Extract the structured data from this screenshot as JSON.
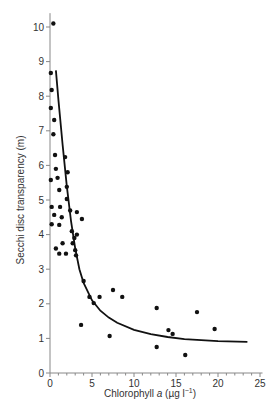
{
  "chart_data": {
    "type": "scatter",
    "title": "",
    "xlabel": "Chlorophyll a (µg l⁻¹)",
    "xlabel_parts": {
      "pre": "Chlorophyll ",
      "italic": "a",
      "post": " (µg l",
      "sup": "−1",
      "end": ")"
    },
    "ylabel": "Secchi disc transparency (m)",
    "xlim": [
      0,
      25
    ],
    "ylim": [
      0,
      10
    ],
    "x_ticks": [
      0,
      5,
      10,
      15,
      20,
      25
    ],
    "y_ticks": [
      0,
      1,
      2,
      3,
      4,
      5,
      6,
      7,
      8,
      9,
      10
    ],
    "grid": false,
    "legend": null,
    "series": [
      {
        "name": "observations",
        "kind": "scatter",
        "points": [
          [
            0.4,
            10.1
          ],
          [
            0.1,
            8.67
          ],
          [
            0.2,
            8.18
          ],
          [
            0.1,
            7.66
          ],
          [
            0.5,
            7.31
          ],
          [
            0.4,
            6.9
          ],
          [
            0.6,
            6.3
          ],
          [
            1.8,
            6.24
          ],
          [
            0.7,
            5.9
          ],
          [
            2.1,
            5.8
          ],
          [
            0.1,
            5.58
          ],
          [
            0.9,
            5.64
          ],
          [
            2.0,
            5.38
          ],
          [
            1.1,
            5.29
          ],
          [
            2.0,
            5.03
          ],
          [
            0.2,
            4.8
          ],
          [
            1.2,
            4.8
          ],
          [
            2.4,
            4.7
          ],
          [
            3.2,
            4.65
          ],
          [
            0.5,
            4.57
          ],
          [
            1.4,
            4.5
          ],
          [
            3.8,
            4.45
          ],
          [
            0.2,
            4.3
          ],
          [
            1.1,
            4.28
          ],
          [
            2.6,
            4.1
          ],
          [
            3.2,
            4.0
          ],
          [
            1.5,
            3.75
          ],
          [
            2.9,
            3.9
          ],
          [
            2.7,
            3.75
          ],
          [
            0.7,
            3.6
          ],
          [
            1.1,
            3.45
          ],
          [
            1.9,
            3.45
          ],
          [
            3.0,
            3.55
          ],
          [
            3.1,
            3.4
          ],
          [
            4.0,
            2.66
          ],
          [
            4.7,
            2.2
          ],
          [
            5.2,
            2.02
          ],
          [
            5.9,
            2.2
          ],
          [
            7.5,
            2.4
          ],
          [
            8.6,
            2.2
          ],
          [
            3.7,
            1.39
          ],
          [
            7.1,
            1.07
          ],
          [
            12.7,
            1.88
          ],
          [
            12.7,
            0.75
          ],
          [
            14.1,
            1.24
          ],
          [
            14.6,
            1.13
          ],
          [
            16.1,
            0.52
          ],
          [
            17.5,
            1.76
          ],
          [
            19.6,
            1.27
          ]
        ]
      },
      {
        "name": "fitted curve",
        "kind": "line",
        "points": [
          [
            0.7,
            8.75
          ],
          [
            1.0,
            7.9
          ],
          [
            1.5,
            6.6
          ],
          [
            2.0,
            5.4
          ],
          [
            2.5,
            4.4
          ],
          [
            3.0,
            3.6
          ],
          [
            3.5,
            3.0
          ],
          [
            4.0,
            2.6
          ],
          [
            5.0,
            2.1
          ],
          [
            6.0,
            1.8
          ],
          [
            7.0,
            1.6
          ],
          [
            8.0,
            1.45
          ],
          [
            10.0,
            1.25
          ],
          [
            12.0,
            1.12
          ],
          [
            14.0,
            1.04
          ],
          [
            16.0,
            0.98
          ],
          [
            18.0,
            0.95
          ],
          [
            20.0,
            0.92
          ],
          [
            23.5,
            0.9
          ]
        ]
      }
    ]
  },
  "colors": {
    "points": "#111111",
    "curve": "#111111",
    "axis": "#888888",
    "text": "#333333"
  }
}
